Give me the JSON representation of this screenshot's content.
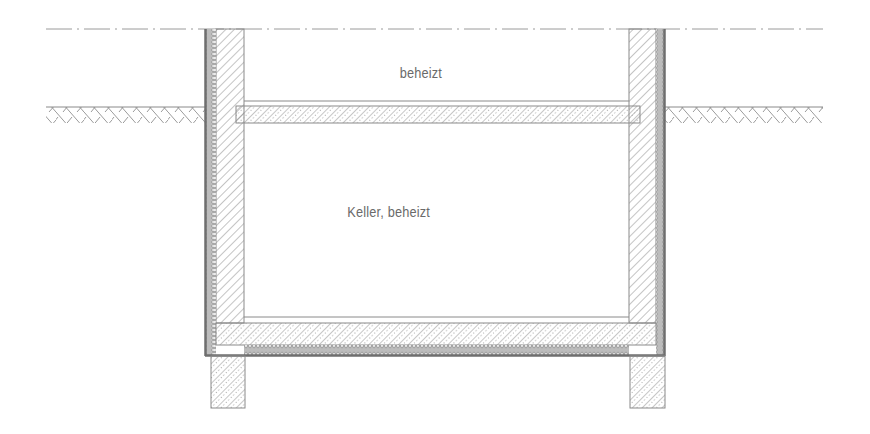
{
  "diagram": {
    "type": "building-section",
    "labels": {
      "upper_room": "beheizt",
      "basement": "Keller, beheizt"
    },
    "elements": [
      {
        "id": "ground-level-line",
        "kind": "dash-dot reference line"
      },
      {
        "id": "ground-surface-left",
        "kind": "earth hatch"
      },
      {
        "id": "ground-surface-right",
        "kind": "earth hatch"
      },
      {
        "id": "left-wall",
        "kind": "masonry wall"
      },
      {
        "id": "right-wall",
        "kind": "masonry wall"
      },
      {
        "id": "left-perimeter-insulation",
        "kind": "insulation"
      },
      {
        "id": "right-perimeter-insulation",
        "kind": "insulation"
      },
      {
        "id": "ground-floor-slab",
        "kind": "reinforced concrete slab"
      },
      {
        "id": "basement-floor-slab",
        "kind": "reinforced concrete slab"
      },
      {
        "id": "under-slab-insulation",
        "kind": "insulation"
      },
      {
        "id": "left-foundation",
        "kind": "strip foundation"
      },
      {
        "id": "right-foundation",
        "kind": "strip foundation"
      }
    ],
    "colors": {
      "line": "#8a8a8a",
      "dark_line": "#6e6e6e",
      "text": "#6a6a6a"
    }
  }
}
